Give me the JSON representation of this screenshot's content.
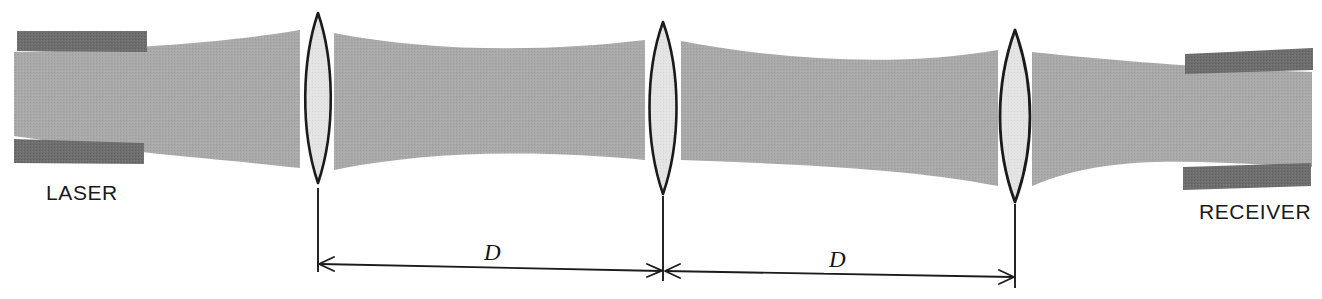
{
  "figure": {
    "labels": {
      "laser": "LASER",
      "receiver": "RECEIVER",
      "distance_1": "D",
      "distance_2": "D"
    },
    "colors": {
      "beam": "#a9a9a9",
      "housing": "#6e6e6e",
      "lens_fill": "#e2e2e2",
      "lens_outline": "#1b1b1b",
      "dimension_line": "#1b1b1b",
      "background": "#ffffff",
      "text": "#1a1a1a"
    },
    "components": [
      {
        "name": "laser-housing",
        "kind": "source-enclosure",
        "label": "LASER"
      },
      {
        "name": "lens-1",
        "kind": "biconvex-lens",
        "index": 1
      },
      {
        "name": "lens-2",
        "kind": "biconvex-lens",
        "index": 2
      },
      {
        "name": "lens-3",
        "kind": "biconvex-lens",
        "index": 3
      },
      {
        "name": "receiver-housing",
        "kind": "detector-enclosure",
        "label": "RECEIVER"
      },
      {
        "name": "beam-envelope",
        "kind": "gaussian-beam"
      }
    ],
    "dimensions": [
      {
        "name": "span-lens1-lens2",
        "label": "D",
        "from": "lens-1",
        "to": "lens-2"
      },
      {
        "name": "span-lens2-lens3",
        "label": "D",
        "from": "lens-2",
        "to": "lens-3"
      }
    ]
  }
}
